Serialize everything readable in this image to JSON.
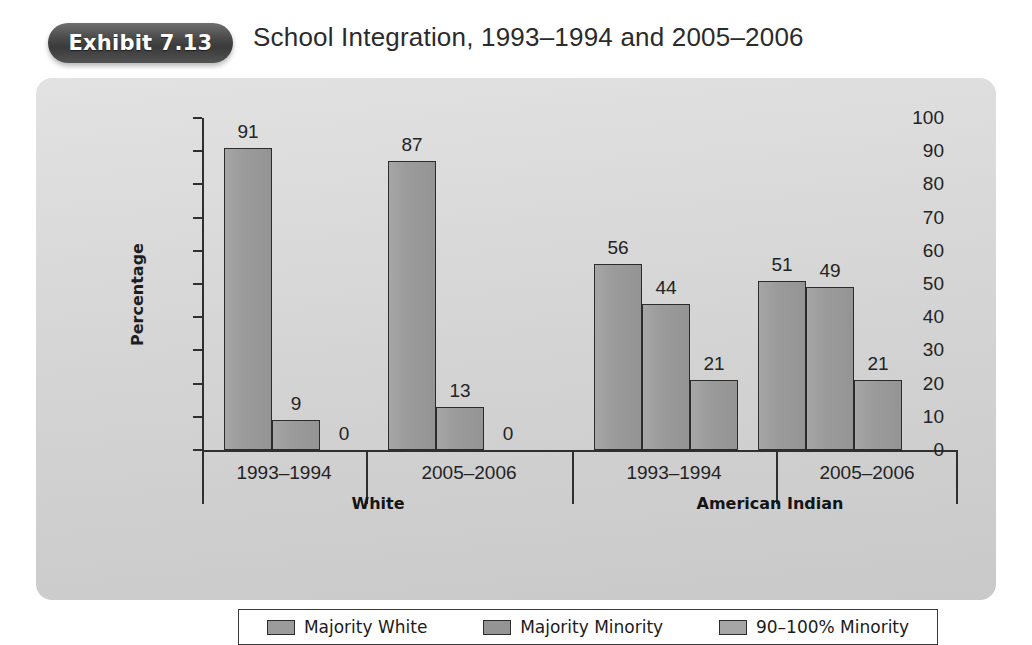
{
  "header": {
    "exhibit_badge": "Exhibit 7.13",
    "title": "School Integration, 1993–1994 and 2005–2006"
  },
  "chart_data": {
    "type": "bar",
    "title": "School Integration, 1993–1994 and 2005–2006",
    "xlabel": "",
    "ylabel": "Percentage",
    "ylim": [
      0,
      100
    ],
    "ytick_step": 10,
    "yticks": [
      100,
      90,
      80,
      70,
      60,
      50,
      40,
      30,
      20,
      10,
      0
    ],
    "grid": false,
    "legend_position": "bottom",
    "series": [
      {
        "name": "Majority White",
        "color": "#9b9b9b",
        "values": [
          91,
          87,
          56,
          51
        ]
      },
      {
        "name": "Majority Minority",
        "color": "#949494",
        "values": [
          9,
          13,
          44,
          49
        ]
      },
      {
        "name": "90–100% Minority",
        "color": "#a6a6a6",
        "values": [
          0,
          0,
          21,
          21
        ]
      }
    ],
    "categories": [
      "1993–1994",
      "2005–2006",
      "1993–1994",
      "2005–2006"
    ],
    "category_groups": [
      {
        "label": "White",
        "categories": [
          "1993–1994",
          "2005–2006"
        ]
      },
      {
        "label": "American Indian",
        "categories": [
          "1993–1994",
          "2005–2006"
        ]
      }
    ],
    "groups": [
      {
        "race": "White",
        "period": "1993–1994",
        "bars": [
          {
            "series": "Majority White",
            "value": 91,
            "label": "91"
          },
          {
            "series": "Majority Minority",
            "value": 9,
            "label": "9"
          },
          {
            "series": "90–100% Minority",
            "value": 0,
            "label": "0"
          }
        ]
      },
      {
        "race": "White",
        "period": "2005–2006",
        "bars": [
          {
            "series": "Majority White",
            "value": 87,
            "label": "87"
          },
          {
            "series": "Majority Minority",
            "value": 13,
            "label": "13"
          },
          {
            "series": "90–100% Minority",
            "value": 0,
            "label": "0"
          }
        ]
      },
      {
        "race": "American Indian",
        "period": "1993–1994",
        "bars": [
          {
            "series": "Majority White",
            "value": 56,
            "label": "56"
          },
          {
            "series": "Majority Minority",
            "value": 44,
            "label": "44"
          },
          {
            "series": "90–100% Minority",
            "value": 21,
            "label": "21"
          }
        ]
      },
      {
        "race": "American Indian",
        "period": "2005–2006",
        "bars": [
          {
            "series": "Majority White",
            "value": 51,
            "label": "51"
          },
          {
            "series": "Majority Minority",
            "value": 49,
            "label": "49"
          },
          {
            "series": "90–100% Minority",
            "value": 21,
            "label": "21"
          }
        ]
      }
    ]
  },
  "legend": {
    "items": [
      {
        "label": "Majority White",
        "color": "#9b9b9b"
      },
      {
        "label": "Majority Minority",
        "color": "#949494"
      },
      {
        "label": "90–100% Minority",
        "color": "#a6a6a6"
      }
    ]
  },
  "colors": {
    "page_background": "#ffffff",
    "panel_background": "#d4d4d4",
    "bar_fill": "#9b9b9b",
    "bar_outline": "#2c2c2c",
    "axis": "#2f2f2f",
    "badge": "#3f3f3f",
    "text": "#232323"
  }
}
